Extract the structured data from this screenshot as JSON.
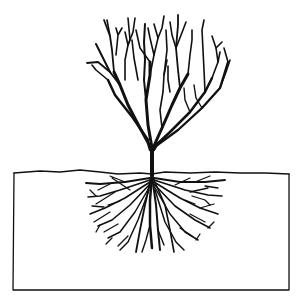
{
  "illustration": {
    "subject": "tree with root system in soil cross-section",
    "style": "black line art on white",
    "colors": {
      "ink": "#111111",
      "background": "#ffffff"
    }
  }
}
